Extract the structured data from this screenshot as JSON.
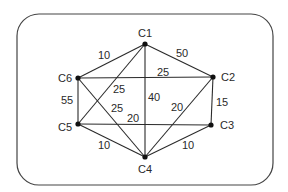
{
  "diagram": {
    "type": "weighted-undirected-graph",
    "frame": {
      "x": 17,
      "y": 14,
      "width": 256,
      "height": 171,
      "radius": 22,
      "stroke": "#444444"
    },
    "nodes": [
      {
        "id": "C1",
        "label": "C1",
        "x": 145,
        "y": 44,
        "label_x": 145,
        "label_y": 37,
        "anchor": "middle"
      },
      {
        "id": "C2",
        "label": "C2",
        "x": 213,
        "y": 77,
        "label_x": 221,
        "label_y": 81,
        "anchor": "start"
      },
      {
        "id": "C3",
        "label": "C3",
        "x": 211,
        "y": 125,
        "label_x": 220,
        "label_y": 129,
        "anchor": "start"
      },
      {
        "id": "C4",
        "label": "C4",
        "x": 145,
        "y": 157,
        "label_x": 145,
        "label_y": 173,
        "anchor": "middle"
      },
      {
        "id": "C5",
        "label": "C5",
        "x": 78,
        "y": 124,
        "label_x": 72,
        "label_y": 131,
        "anchor": "end"
      },
      {
        "id": "C6",
        "label": "C6",
        "x": 78,
        "y": 78,
        "label_x": 72,
        "label_y": 82,
        "anchor": "end"
      }
    ],
    "edges": [
      {
        "from": "C1",
        "to": "C6",
        "weight": "10",
        "label_x": 104,
        "label_y": 59
      },
      {
        "from": "C1",
        "to": "C2",
        "weight": "50",
        "label_x": 182,
        "label_y": 57
      },
      {
        "from": "C6",
        "to": "C2",
        "weight": "25",
        "label_x": 163,
        "label_y": 76
      },
      {
        "from": "C1",
        "to": "C5",
        "weight": "25",
        "label_x": 119,
        "label_y": 93
      },
      {
        "from": "C1",
        "to": "C4",
        "weight": "40",
        "label_x": 154,
        "label_y": 101
      },
      {
        "from": "C6",
        "to": "C5",
        "weight": "55",
        "label_x": 67,
        "label_y": 104
      },
      {
        "from": "C2",
        "to": "C3",
        "weight": "15",
        "label_x": 222,
        "label_y": 106
      },
      {
        "from": "C6",
        "to": "C4",
        "weight": "25",
        "label_x": 117,
        "label_y": 112
      },
      {
        "from": "C2",
        "to": "C4",
        "weight": "20",
        "label_x": 177,
        "label_y": 111
      },
      {
        "from": "C5",
        "to": "C3",
        "weight": "20",
        "label_x": 133,
        "label_y": 122
      },
      {
        "from": "C5",
        "to": "C4",
        "weight": "10",
        "label_x": 104,
        "label_y": 149
      },
      {
        "from": "C3",
        "to": "C4",
        "weight": "10",
        "label_x": 188,
        "label_y": 149
      }
    ],
    "colors": {
      "line": "#2a2a2a",
      "node": "#111111",
      "text": "#2a2a2a"
    }
  }
}
